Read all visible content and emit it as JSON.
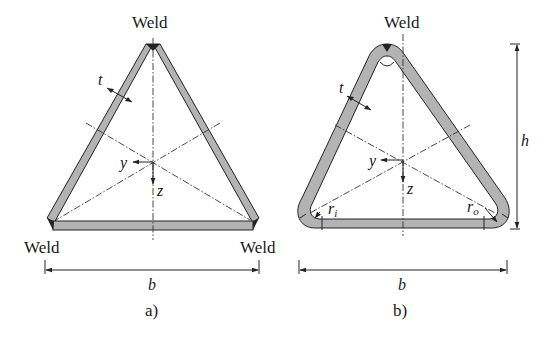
{
  "figure": {
    "panels": [
      {
        "id": "a",
        "caption": "a)",
        "description": "Equilateral triangular hollow section assembled from three flat plates welded at the corners",
        "weld_labels": [
          "Weld",
          "Weld",
          "Weld"
        ],
        "thickness_label": "t",
        "axis_y_label": "y",
        "axis_z_label": "z",
        "width_label": "b"
      },
      {
        "id": "b",
        "caption": "b)",
        "description": "Cold-formed triangular hollow section with rounded corners and single weld at top",
        "weld_labels": [
          "Weld"
        ],
        "thickness_label": "t",
        "axis_y_label": "y",
        "axis_z_label": "z",
        "width_label": "b",
        "height_label": "h",
        "inner_radius_label": "r",
        "inner_radius_sub": "i",
        "outer_radius_label": "r",
        "outer_radius_sub": "o"
      }
    ]
  },
  "colors": {
    "wall_fill": "#b3b3b3",
    "line": "#222222",
    "background": "#ffffff"
  }
}
